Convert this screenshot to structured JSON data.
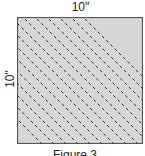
{
  "diagram": {
    "width_label": "10\"",
    "height_label": "10\"",
    "caption": "Figure 3",
    "fill_color": "#d6d6d6",
    "border_color": "#555555",
    "line_color": "#333333",
    "line_count": 11
  }
}
